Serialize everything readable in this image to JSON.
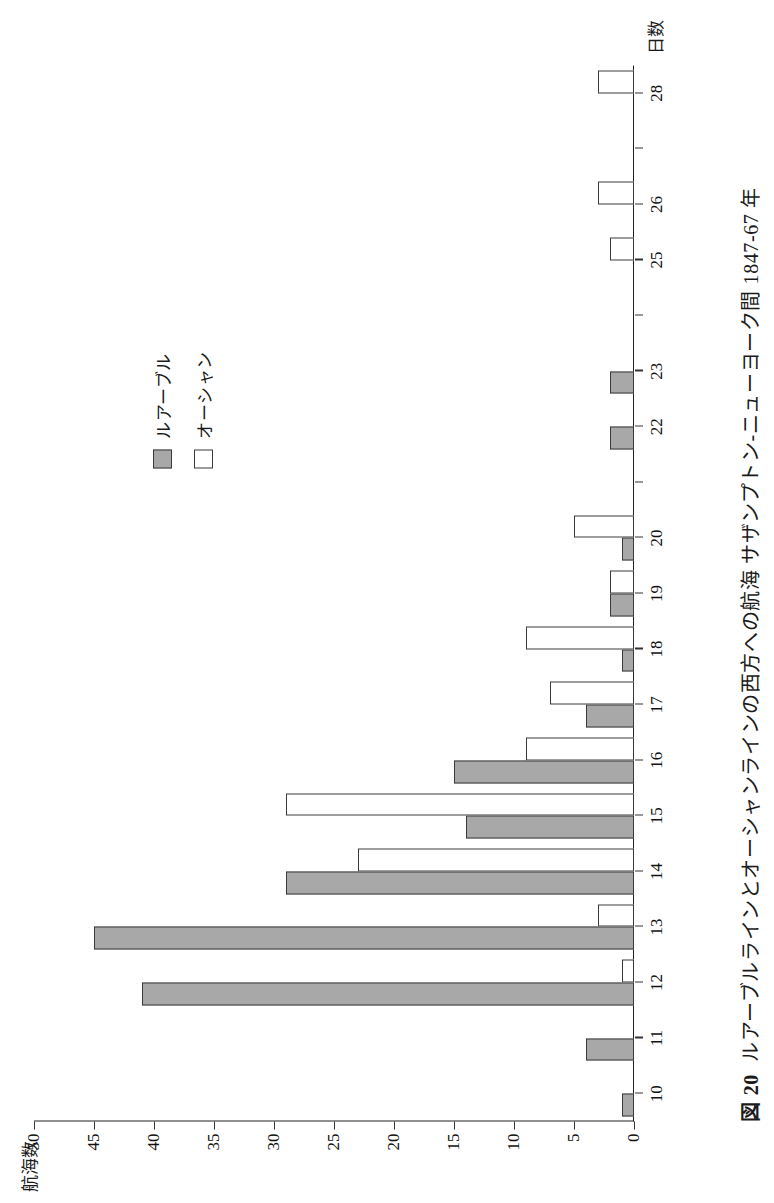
{
  "figure": {
    "number_label": "図 20",
    "caption": "ルアーブルラインとオーシャンラインの西方への航海 サザンプトン-ニューヨーク間 1847-67 年"
  },
  "legend": {
    "position": "top-right",
    "items": [
      {
        "label": "ルアーブル",
        "swatch": "gray-filled-square",
        "color": "#a8a8a8"
      },
      {
        "label": "オーシャン",
        "swatch": "white-outline-square",
        "color": "#ffffff"
      }
    ]
  },
  "chart_data": {
    "type": "bar",
    "orientation": "vertical-grouped",
    "xlabel": "日数",
    "ylabel": "航海数",
    "ylim": [
      0,
      50
    ],
    "ytick_labels": [
      "0",
      "5",
      "10",
      "15",
      "20",
      "25",
      "30",
      "35",
      "40",
      "45",
      "50"
    ],
    "ytick_values": [
      0,
      5,
      10,
      15,
      20,
      25,
      30,
      35,
      40,
      45,
      50
    ],
    "grid": false,
    "legend_position": "top-right",
    "categories": [
      "10",
      "11",
      "12",
      "13",
      "14",
      "15",
      "16",
      "17",
      "18",
      "19",
      "20",
      "21",
      "22",
      "23",
      "24",
      "25",
      "26",
      "27",
      "28"
    ],
    "xtick_labels_shown": [
      "10",
      "11",
      "12",
      "13",
      "14",
      "15",
      "16",
      "17",
      "18",
      "19",
      "20",
      "22",
      "23",
      "25",
      "26",
      "28"
    ],
    "series": [
      {
        "name": "ルアーブル",
        "color": "#a8a8a8",
        "values": [
          1,
          4,
          41,
          45,
          29,
          14,
          15,
          4,
          1,
          2,
          1,
          0,
          2,
          2,
          0,
          0,
          0,
          0,
          0
        ]
      },
      {
        "name": "オーシャン",
        "color": "#ffffff",
        "values": [
          0,
          0,
          1,
          3,
          23,
          29,
          9,
          7,
          9,
          2,
          5,
          0,
          0,
          0,
          0,
          2,
          3,
          0,
          3
        ]
      }
    ]
  }
}
